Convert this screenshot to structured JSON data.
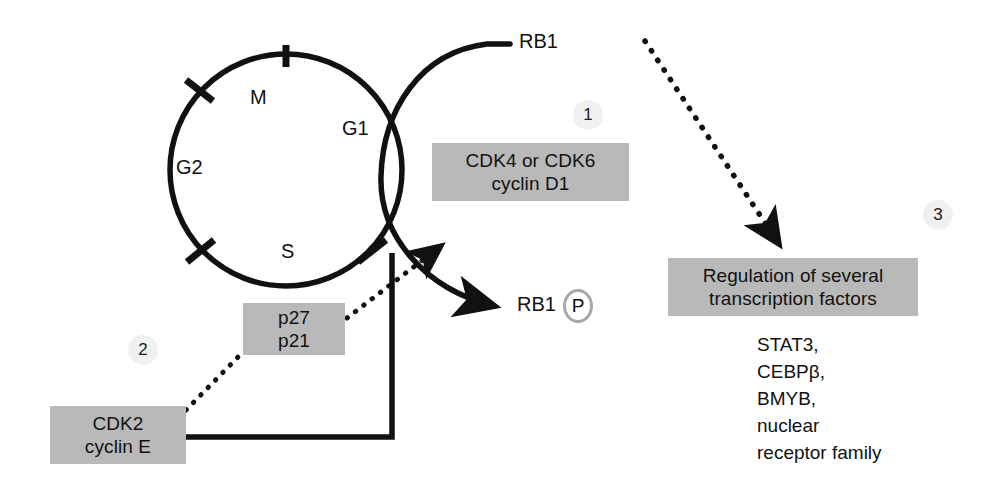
{
  "diagram": {
    "background_color": "#ffffff",
    "box_fill": "#b9b9b9",
    "badge_fill": "#f0f0f0",
    "stroke_color": "#111111"
  },
  "cell_cycle": {
    "phases": [
      {
        "label": "M",
        "x": 255,
        "y": 96
      },
      {
        "label": "G1",
        "x": 348,
        "y": 127
      },
      {
        "label": "G2",
        "x": 182,
        "y": 166
      },
      {
        "label": "S",
        "x": 285,
        "y": 250
      }
    ],
    "tick_count": 4
  },
  "nodes": {
    "cdk46": {
      "line1": "CDK4 or CDK6",
      "line2": "cyclin D1"
    },
    "p27p21": {
      "line1": "p27",
      "line2": "p21"
    },
    "cdk2": {
      "line1": "CDK2",
      "line2": "cyclin E"
    },
    "regulation": {
      "line1": "Regulation of several",
      "line2": "transcription factors"
    }
  },
  "labels": {
    "rb1_top": "RB1",
    "rb1_phospho": "RB1",
    "phospho_mark": "P"
  },
  "transcription_factors": [
    "STAT3,",
    "CEBPβ,",
    "BMYB,",
    "nuclear",
    "receptor family"
  ],
  "step_badges": [
    {
      "label": "1",
      "x": 573,
      "y": 100
    },
    {
      "label": "2",
      "x": 128,
      "y": 335
    },
    {
      "label": "3",
      "x": 923,
      "y": 200
    }
  ]
}
